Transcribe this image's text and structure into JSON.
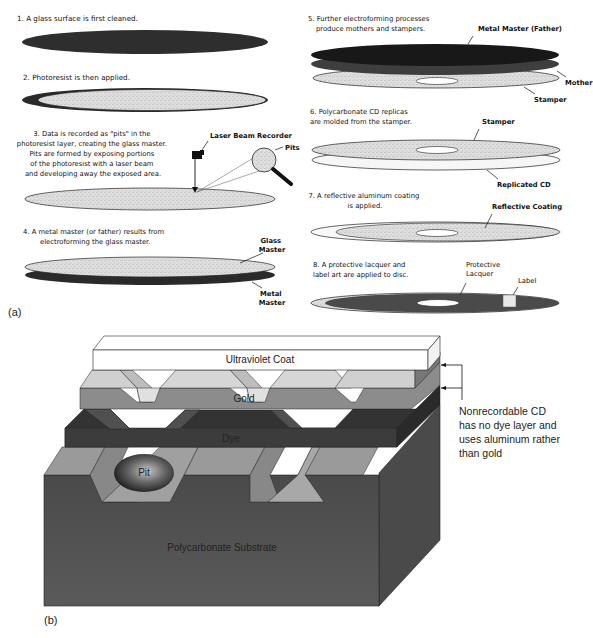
{
  "figure": {
    "panel_a_label": "(a)",
    "panel_b_label": "(b)"
  },
  "panel_a": {
    "steps": [
      {
        "number": "1.",
        "text": [
          "A glass surface is first cleaned."
        ]
      },
      {
        "number": "2.",
        "text": [
          "Photoresist is then applied."
        ]
      },
      {
        "number": "3.",
        "text": [
          "Data is recorded as \"pits\" in the",
          "photoresist layer, creating the glass master.",
          "Pits are formed by exposing portions",
          "of the photoresist with a laser beam",
          "and developing away the exposed area."
        ]
      },
      {
        "number": "4.",
        "text": [
          "A metal master (or father) results from",
          "electroforming the glass master."
        ]
      },
      {
        "number": "5.",
        "text": [
          "Further electroforming processes",
          "produce mothers and stampers."
        ]
      },
      {
        "number": "6.",
        "text": [
          "Polycarbonate CD replicas",
          "are molded from the stamper."
        ]
      },
      {
        "number": "7.",
        "text": [
          "A reflective aluminum coating",
          "is applied."
        ]
      },
      {
        "number": "8.",
        "text": [
          "A protective lacquer and",
          "label art are applied to disc."
        ]
      }
    ],
    "labels": {
      "laser_beam_recorder": "Laser Beam Recorder",
      "pits": "Pits",
      "glass_master": [
        "Glass",
        "Master"
      ],
      "metal_master": [
        "Metal",
        "Master"
      ],
      "metal_master_father": "Metal Master (Father)",
      "mother": "Mother",
      "stamper": "Stamper",
      "stamper_6": "Stamper",
      "replicated_cd": "Replicated CD",
      "reflective_coating": "Reflective Coating",
      "protective_lacquer": [
        "Protective",
        "Lacquer"
      ],
      "label": "Label"
    }
  },
  "panel_b": {
    "layers": [
      {
        "name": "Ultraviolet Coat",
        "color": "#ffffff"
      },
      {
        "name": "Gold",
        "color": "#8a8a8a"
      },
      {
        "name": "Dye",
        "color": "#444444"
      },
      {
        "name": "Polycarbonate Substrate",
        "color": "#5c5c5c"
      }
    ],
    "pit_label": "Pit",
    "note": [
      "Nonrecordable CD",
      "has no dye layer and",
      "uses aluminum rather",
      "than gold"
    ]
  }
}
